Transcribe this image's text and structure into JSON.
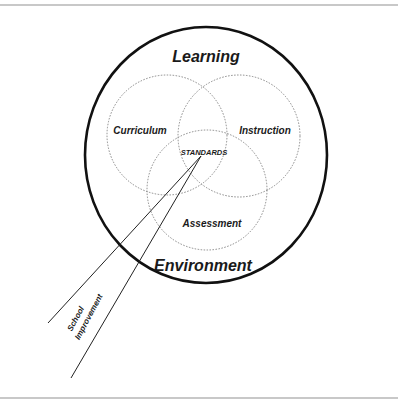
{
  "diagram": {
    "outer_circle": {
      "top_label": "Learning",
      "bottom_label": "Environment"
    },
    "inner_circles": [
      {
        "label": "Curriculum"
      },
      {
        "label": "Instruction"
      },
      {
        "label": "Assessment"
      }
    ],
    "center_label": "STANDARDS",
    "beam": {
      "line1": "School",
      "line2": "Improvement"
    }
  },
  "colors": {
    "stroke": "#111111",
    "dotted": "#888888",
    "rule": "#c8c8c8"
  }
}
